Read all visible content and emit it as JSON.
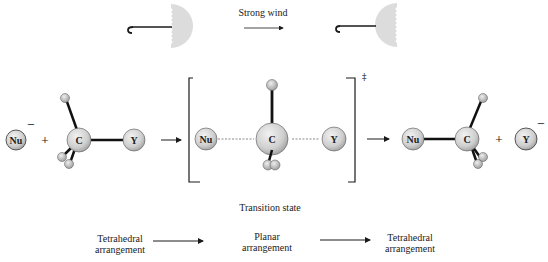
{
  "analogy": {
    "arrow_label": "Strong wind",
    "before_icon": "umbrella-open-icon",
    "after_icon": "umbrella-inverted-icon"
  },
  "reaction": {
    "reactants": {
      "nucleophile": {
        "label": "Nu",
        "charge": "−"
      },
      "plus": "+",
      "substrate": {
        "center": "C",
        "leaving_group": "Y"
      }
    },
    "transition_state": {
      "nucleophile": "Nu",
      "center": "C",
      "leaving_group": "Y",
      "double_dagger": "‡",
      "caption": "Transition state"
    },
    "products": {
      "substrate": {
        "center": "C",
        "nucleophile": "Nu"
      },
      "plus": "+",
      "leaving_group": {
        "label": "Y",
        "charge": "−"
      }
    }
  },
  "geometry": {
    "stages": [
      {
        "line1": "Tetrahedral",
        "line2": "arrangement"
      },
      {
        "line1": "Planar",
        "line2": "arrangement"
      },
      {
        "line1": "Tetrahedral",
        "line2": "arrangement"
      }
    ]
  },
  "colors": {
    "atom_fill": "#d9d9d9",
    "umbrella_fill": "#dcdcdc",
    "ink": "#1a1a1a"
  }
}
